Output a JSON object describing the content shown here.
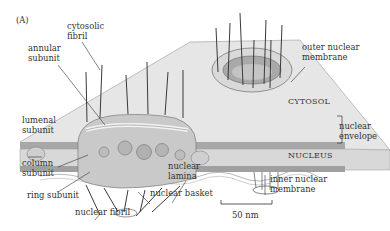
{
  "figure": {
    "panel_label": "(A)",
    "scale_bar": "50 nm"
  },
  "labels": {
    "cytosolic_fibril": "cytosolic\nfibril",
    "annular_subunit": "annular\nsubunit",
    "lumenal_subunit": "lumenal\nsubunit",
    "column_subunit": "column\nsubunit",
    "ring_subunit": "ring subunit",
    "nuclear_fibril": "nuclear fibril",
    "nuclear_basket": "nuclear basket",
    "nuclear_lamina": "nuclear\nlamina",
    "inner_nuclear_membrane": "inner nuclear\nmembrane",
    "outer_nuclear_membrane": "outer nuclear\nmembrane",
    "cytosol": "CYTOSOL",
    "nuclear_envelope": "nuclear\nenvelope",
    "nucleus": "NUCLEUS"
  },
  "colors": {
    "membrane_top": "#e4e4e4",
    "membrane_edge": "#8a8a8a",
    "lumen": "#d0d0d0",
    "subunit": "#b8b8b8",
    "fibril": "#3a3a3a",
    "text": "#333333"
  }
}
